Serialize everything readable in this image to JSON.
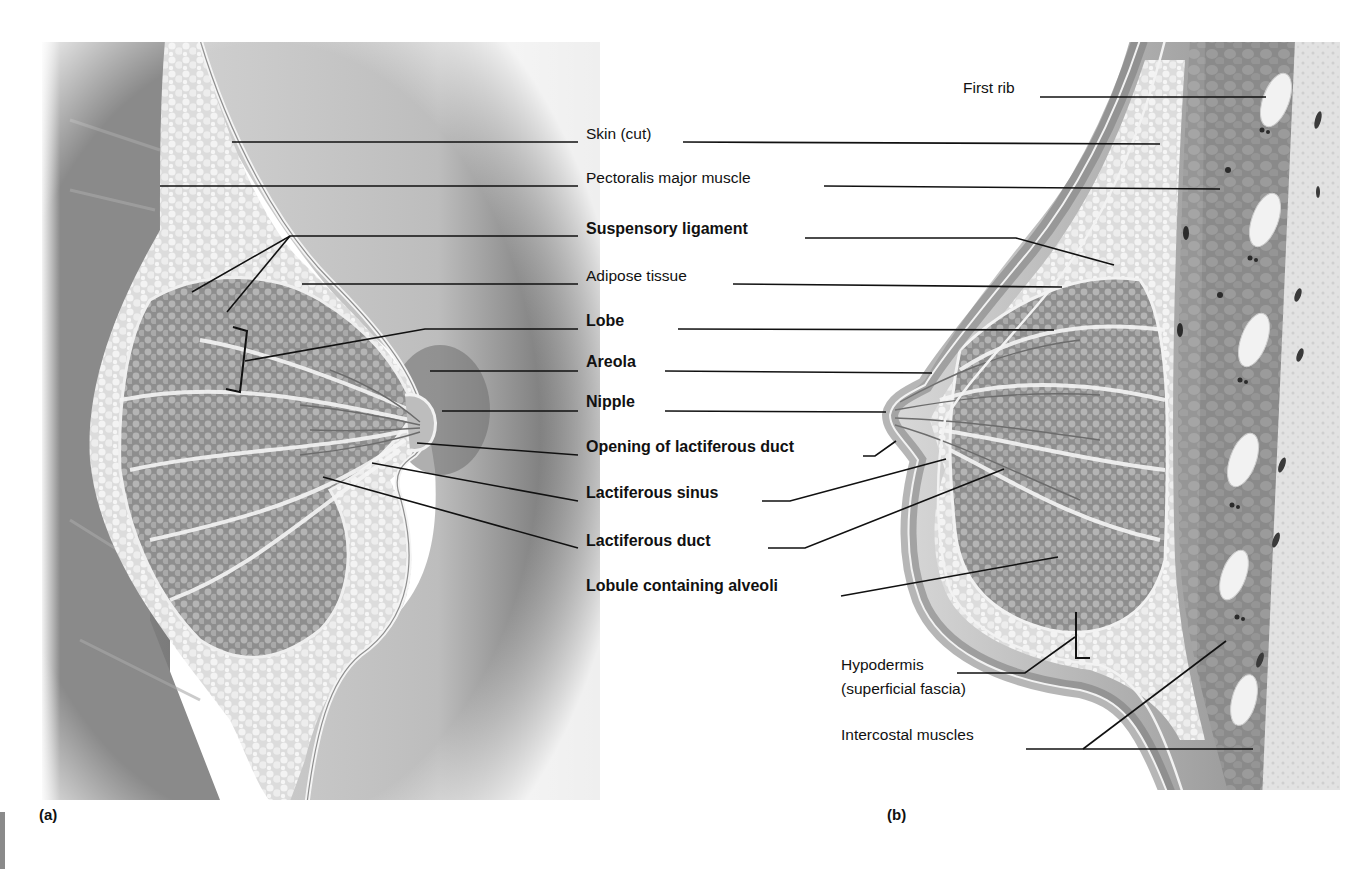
{
  "figure": {
    "panels": [
      {
        "id": "a",
        "tag": "(a)",
        "view": "anterolateral cutaway"
      },
      {
        "id": "b",
        "tag": "(b)",
        "view": "sagittal section"
      }
    ],
    "colors": {
      "background": "#ffffff",
      "skin": "#b9b9b9",
      "skin_dark": "#7d7d7d",
      "adipose": "#e4e4e4",
      "lobe": "#9a9a9a",
      "muscle": "#8c8c8c",
      "rib": "#f0f0f0",
      "leader_line": "#111111",
      "text": "#111111"
    }
  },
  "labels": {
    "center": [
      {
        "key": "skin",
        "text": "Skin (cut)",
        "bold": false,
        "x": 586,
        "y": 134
      },
      {
        "key": "pectoralis",
        "text": "Pectoralis major muscle",
        "bold": false,
        "x": 586,
        "y": 178
      },
      {
        "key": "suspensory",
        "text": "Suspensory ligament",
        "bold": true,
        "x": 586,
        "y": 229
      },
      {
        "key": "adipose",
        "text": "Adipose tissue",
        "bold": false,
        "x": 586,
        "y": 276
      },
      {
        "key": "lobe",
        "text": "Lobe",
        "bold": true,
        "x": 586,
        "y": 321
      },
      {
        "key": "areola",
        "text": "Areola",
        "bold": true,
        "x": 586,
        "y": 362
      },
      {
        "key": "nipple",
        "text": "Nipple",
        "bold": true,
        "x": 586,
        "y": 402
      },
      {
        "key": "opening",
        "text": "Opening of lactiferous duct",
        "bold": true,
        "x": 586,
        "y": 447
      },
      {
        "key": "sinus",
        "text": "Lactiferous sinus",
        "bold": true,
        "x": 586,
        "y": 493
      },
      {
        "key": "duct",
        "text": "Lactiferous duct",
        "bold": true,
        "x": 586,
        "y": 541
      },
      {
        "key": "lobule",
        "text": "Lobule containing alveoli",
        "bold": true,
        "x": 586,
        "y": 586
      }
    ],
    "right": [
      {
        "key": "first_rib",
        "text": "First rib",
        "bold": false,
        "x": 963,
        "y": 88
      },
      {
        "key": "hypodermis_1",
        "text": "Hypodermis",
        "bold": false,
        "x": 841,
        "y": 665
      },
      {
        "key": "hypodermis_2",
        "text": "(superficial fascia)",
        "bold": false,
        "x": 841,
        "y": 689
      },
      {
        "key": "intercostal",
        "text": "Intercostal muscles",
        "bold": false,
        "x": 841,
        "y": 735
      }
    ]
  },
  "leaders": [
    {
      "key": "skin_a",
      "points": "232,142 578,142"
    },
    {
      "key": "skin_b",
      "points": "683,142 1160,144"
    },
    {
      "key": "pect_a",
      "points": "160,186 578,186"
    },
    {
      "key": "pect_b",
      "points": "824,186 1220,189"
    },
    {
      "key": "susp_a",
      "points": "578,236 290,236 192,292"
    },
    {
      "key": "susp_a2",
      "points": "290,236 227,312"
    },
    {
      "key": "susp_b",
      "points": "805,238 1016,238 1114,265"
    },
    {
      "key": "adip_a",
      "points": "302,284 578,284"
    },
    {
      "key": "adip_b",
      "points": "733,284 1062,287"
    },
    {
      "key": "lobe_a",
      "points": "578,329 425,329 245,361"
    },
    {
      "key": "lobe_b",
      "points": "678,329 1054,330"
    },
    {
      "key": "areola_a",
      "points": "430,371 578,371"
    },
    {
      "key": "areola_b",
      "points": "665,371 932,373"
    },
    {
      "key": "nipple_a",
      "points": "442,411 578,411"
    },
    {
      "key": "nipple_b",
      "points": "665,411 886,412"
    },
    {
      "key": "opening_a",
      "points": "417,443 578,455"
    },
    {
      "key": "opening_b",
      "points": "863,456 875,456 896,441"
    },
    {
      "key": "sinus_a",
      "points": "372,463 578,501"
    },
    {
      "key": "sinus_b",
      "points": "762,501 790,501 946,459"
    },
    {
      "key": "duct_a",
      "points": "323,477 578,548"
    },
    {
      "key": "duct_b",
      "points": "768,548 805,548 1004,469"
    },
    {
      "key": "lobule_b",
      "points": "841,596 1058,557"
    },
    {
      "key": "hypo_b",
      "points": "957,673 1025,673 1075,637"
    },
    {
      "key": "inter_b",
      "points": "1026,749 1253,749"
    },
    {
      "key": "inter_b2",
      "points": "1083,749 1226,641"
    },
    {
      "key": "rib_b",
      "points": "1040,97 1266,97"
    }
  ],
  "brackets": [
    {
      "key": "lobe_bracket",
      "points": "233,327 247,331 240,392 226,389"
    },
    {
      "key": "hypodermis_bracket",
      "points": "1076,612 1076,658 1090,658"
    }
  ]
}
